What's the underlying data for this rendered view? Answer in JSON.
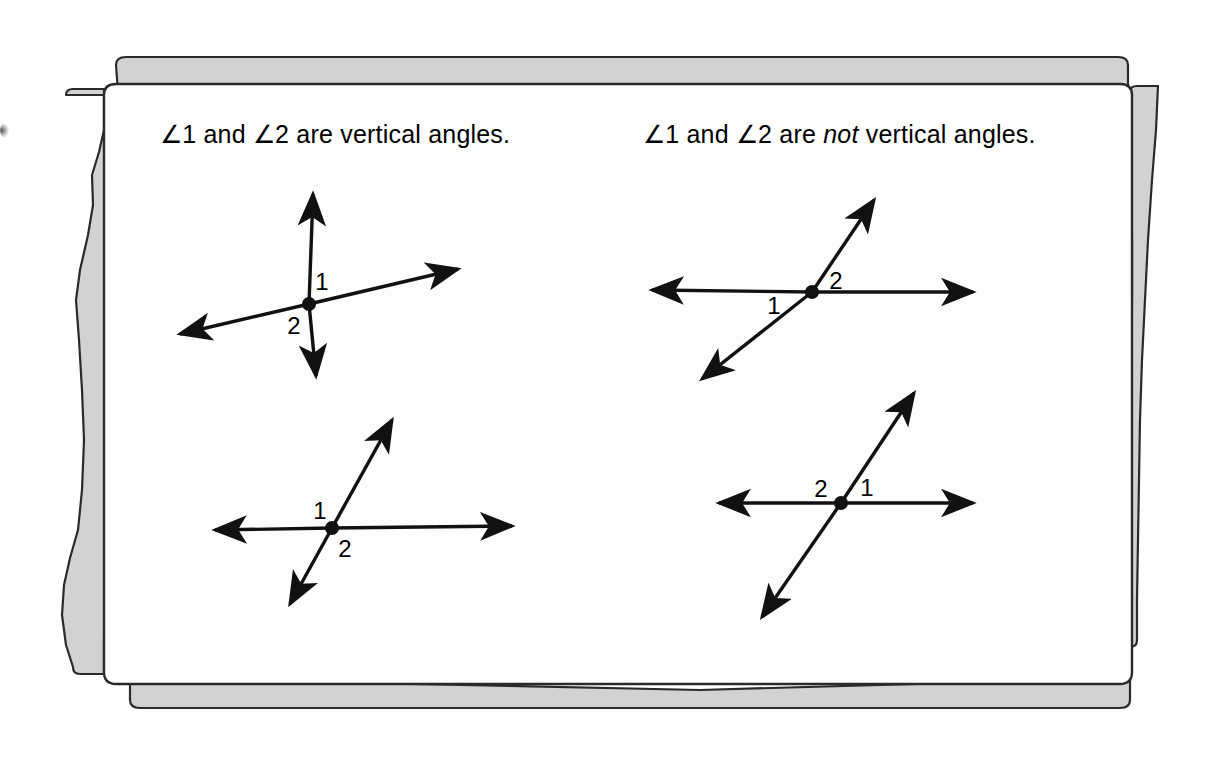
{
  "figure": {
    "kind": "geometry-textbook-illustration",
    "subject": "vertical angles",
    "page_background_color": "#ffffff",
    "paper_top_color": "#fdfdfd",
    "paper_shadow_color": "#cfcfcf",
    "ink_color": "#111111"
  },
  "captions": {
    "left": {
      "full_text": "∠1 and ∠2 are vertical angles.",
      "before_emphasis": "∠1 and ∠2 are vertical angles.",
      "emphasis": "",
      "after_emphasis": ""
    },
    "right": {
      "full_text": "∠1 and ∠2 are not vertical angles.",
      "before_emphasis": "∠1 and ∠2 are ",
      "emphasis": "not",
      "after_emphasis": " vertical angles."
    }
  },
  "diagrams": [
    {
      "id": "top-left",
      "title": "vertical-angles-example-1",
      "vertex": {
        "x": 309,
        "y": 304
      },
      "rays": [
        {
          "name": "ray-up",
          "dx": 4,
          "dy": -110
        },
        {
          "name": "ray-down",
          "dx": 7,
          "dy": 72
        },
        {
          "name": "ray-right-up",
          "dx": 149,
          "dy": -35
        },
        {
          "name": "ray-left-down",
          "dx": -129,
          "dy": 30
        }
      ],
      "labels": [
        {
          "text": "1",
          "x": 322,
          "y": 282
        },
        {
          "text": "2",
          "x": 294,
          "y": 326
        }
      ]
    },
    {
      "id": "bottom-left",
      "title": "vertical-angles-example-2",
      "vertex": {
        "x": 332,
        "y": 528
      },
      "rays": [
        {
          "name": "ray-right",
          "dx": 180,
          "dy": -2
        },
        {
          "name": "ray-left",
          "dx": -117,
          "dy": 2
        },
        {
          "name": "ray-up-right",
          "dx": 60,
          "dy": -108
        },
        {
          "name": "ray-down-left",
          "dx": -42,
          "dy": 76
        }
      ],
      "labels": [
        {
          "text": "1",
          "x": 320,
          "y": 511
        },
        {
          "text": "2",
          "x": 345,
          "y": 549
        }
      ]
    },
    {
      "id": "top-right",
      "title": "not-vertical-angles-example-1",
      "vertex": {
        "x": 812,
        "y": 292
      },
      "rays": [
        {
          "name": "ray-right",
          "dx": 161,
          "dy": 0
        },
        {
          "name": "ray-left",
          "dx": -160,
          "dy": -2
        },
        {
          "name": "ray-up-right",
          "dx": 62,
          "dy": -92
        },
        {
          "name": "ray-down-left",
          "dx": -110,
          "dy": 87
        }
      ],
      "labels": [
        {
          "text": "2",
          "x": 836,
          "y": 281
        },
        {
          "text": "1",
          "x": 774,
          "y": 306
        }
      ]
    },
    {
      "id": "bottom-right",
      "title": "not-vertical-angles-example-2",
      "vertex": {
        "x": 841,
        "y": 503
      },
      "rays": [
        {
          "name": "ray-right",
          "dx": 132,
          "dy": 0
        },
        {
          "name": "ray-left",
          "dx": -122,
          "dy": 0
        },
        {
          "name": "ray-up-right",
          "dx": 73,
          "dy": -110
        },
        {
          "name": "ray-down-left",
          "dx": -79,
          "dy": 114
        }
      ],
      "labels": [
        {
          "text": "2",
          "x": 821,
          "y": 489
        },
        {
          "text": "1",
          "x": 867,
          "y": 488
        }
      ]
    }
  ]
}
